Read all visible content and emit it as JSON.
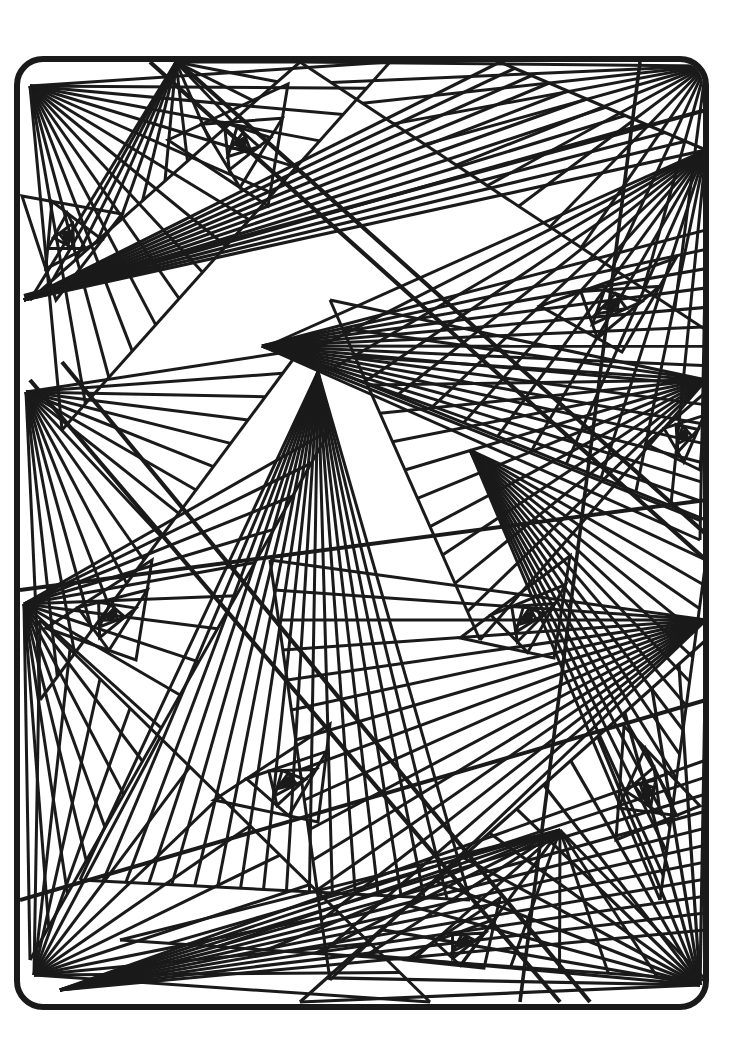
{
  "document": {
    "title": "Geometric Abstract Coloring Page",
    "kind": "line-art-coloring-page",
    "width": 755,
    "height": 1057,
    "background_color": "#ffffff",
    "ink_color": "#1a1a1a",
    "description": "Black-and-white geometric line drawing: rounded-rectangle frame filled with overlapping triangular fan bundles and nested triangle spirals."
  },
  "frame": {
    "name": "rounded-rectangle-border",
    "x": 17,
    "y": 59,
    "width": 689,
    "height": 948,
    "corner_radius": 26,
    "stroke_width": 6,
    "stroke_color": "#1a1a1a",
    "fill": "none"
  },
  "style": {
    "line_color": "#1a1a1a",
    "line_width_thin": 3.0,
    "line_width_medium": 3.6,
    "line_width_thick": 4.6,
    "line_cap": "butt",
    "line_join": "miter"
  },
  "geometry": {
    "clip_inset": 3,
    "fans": [
      {
        "name": "fan-top-left-corner",
        "apex": [
          30,
          86
        ],
        "a": [
          390,
          62
        ],
        "b": [
          62,
          430
        ],
        "rays": 14,
        "width": 3.0,
        "bias": 1.0
      },
      {
        "name": "fan-top-left-upper",
        "apex": [
          176,
          62
        ],
        "a": [
          30,
          300
        ],
        "b": [
          300,
          62
        ],
        "rays": 12,
        "width": 3.0,
        "bias": 1.0
      },
      {
        "name": "fan-top-band",
        "apex": [
          24,
          300
        ],
        "a": [
          500,
          62
        ],
        "b": [
          706,
          150
        ],
        "rays": 11,
        "width": 3.2,
        "bias": 1.1
      },
      {
        "name": "fan-top-right-sweep",
        "apex": [
          706,
          66
        ],
        "a": [
          300,
          62
        ],
        "b": [
          706,
          330
        ],
        "rays": 13,
        "width": 3.0,
        "bias": 1.0
      },
      {
        "name": "fan-upper-right-down",
        "apex": [
          706,
          150
        ],
        "a": [
          270,
          345
        ],
        "b": [
          706,
          520
        ],
        "rays": 13,
        "width": 3.0,
        "bias": 1.05
      },
      {
        "name": "fan-center-diagonal",
        "apex": [
          262,
          346
        ],
        "a": [
          706,
          230
        ],
        "b": [
          700,
          540
        ],
        "rays": 16,
        "width": 3.0,
        "bias": 1.0
      },
      {
        "name": "fan-left-mid-sweep",
        "apex": [
          26,
          392
        ],
        "a": [
          300,
          350
        ],
        "b": [
          40,
          700
        ],
        "rays": 15,
        "width": 3.0,
        "bias": 1.0
      },
      {
        "name": "fan-left-lower-sweep",
        "apex": [
          24,
          604
        ],
        "a": [
          330,
          430
        ],
        "b": [
          30,
          960
        ],
        "rays": 16,
        "width": 3.0,
        "bias": 1.0
      },
      {
        "name": "fan-center-down",
        "apex": [
          318,
          372
        ],
        "a": [
          80,
          880
        ],
        "b": [
          470,
          900
        ],
        "rays": 17,
        "width": 3.0,
        "bias": 1.0
      },
      {
        "name": "fan-mid-right-down",
        "apex": [
          470,
          450
        ],
        "a": [
          706,
          560
        ],
        "b": [
          660,
          900
        ],
        "rays": 14,
        "width": 3.0,
        "bias": 1.0
      },
      {
        "name": "fan-right-mid-left",
        "apex": [
          706,
          620
        ],
        "a": [
          270,
          560
        ],
        "b": [
          330,
          980
        ],
        "rays": 14,
        "width": 3.0,
        "bias": 1.0
      },
      {
        "name": "fan-bottom-left",
        "apex": [
          34,
          975
        ],
        "a": [
          40,
          620
        ],
        "b": [
          430,
          1002
        ],
        "rays": 13,
        "width": 3.0,
        "bias": 1.0
      },
      {
        "name": "fan-bottom-right-corner",
        "apex": [
          700,
          985
        ],
        "a": [
          706,
          640
        ],
        "b": [
          300,
          1002
        ],
        "rays": 15,
        "width": 3.2,
        "bias": 1.0
      },
      {
        "name": "fan-bottom-band",
        "apex": [
          60,
          990
        ],
        "a": [
          706,
          760
        ],
        "b": [
          706,
          930
        ],
        "rays": 10,
        "width": 3.0,
        "bias": 1.0
      },
      {
        "name": "fan-lower-center",
        "apex": [
          560,
          830
        ],
        "a": [
          120,
          940
        ],
        "b": [
          706,
          980
        ],
        "rays": 12,
        "width": 3.0,
        "bias": 1.0
      },
      {
        "name": "fan-right-upper-left",
        "apex": [
          706,
          380
        ],
        "a": [
          330,
          300
        ],
        "b": [
          480,
          640
        ],
        "rays": 12,
        "width": 3.0,
        "bias": 1.0
      }
    ],
    "spirals": [
      {
        "name": "spiral-top-left-small",
        "p1": [
          22,
          196
        ],
        "p2": [
          122,
          214
        ],
        "p3": [
          56,
          300
        ],
        "turns": 7,
        "t": 0.3,
        "width": 3.0
      },
      {
        "name": "spiral-top-center",
        "p1": [
          168,
          140
        ],
        "p2": [
          288,
          84
        ],
        "p3": [
          268,
          206
        ],
        "turns": 8,
        "t": 0.28,
        "width": 3.0
      },
      {
        "name": "spiral-upper-right",
        "p1": [
          540,
          306
        ],
        "p2": [
          676,
          258
        ],
        "p3": [
          622,
          352
        ],
        "turns": 8,
        "t": 0.3,
        "width": 3.0
      },
      {
        "name": "spiral-left-mid",
        "p1": [
          46,
          628
        ],
        "p2": [
          152,
          560
        ],
        "p3": [
          136,
          660
        ],
        "turns": 7,
        "t": 0.3,
        "width": 3.0
      },
      {
        "name": "spiral-center-right",
        "p1": [
          460,
          638
        ],
        "p2": [
          570,
          556
        ],
        "p3": [
          554,
          658
        ],
        "turns": 8,
        "t": 0.28,
        "width": 3.0
      },
      {
        "name": "spiral-lower-center",
        "p1": [
          214,
          800
        ],
        "p2": [
          330,
          724
        ],
        "p3": [
          318,
          822
        ],
        "turns": 8,
        "t": 0.28,
        "width": 3.0
      },
      {
        "name": "spiral-lower-right-tall",
        "p1": [
          616,
          840
        ],
        "p2": [
          624,
          726
        ],
        "p3": [
          700,
          806
        ],
        "turns": 8,
        "t": 0.28,
        "width": 3.0
      },
      {
        "name": "spiral-bottom-center",
        "p1": [
          406,
          960
        ],
        "p2": [
          500,
          898
        ],
        "p3": [
          484,
          968
        ],
        "turns": 7,
        "t": 0.3,
        "width": 3.0
      },
      {
        "name": "spiral-right-edge",
        "p1": [
          646,
          444
        ],
        "p2": [
          706,
          392
        ],
        "p3": [
          700,
          470
        ],
        "turns": 6,
        "t": 0.3,
        "width": 3.0
      }
    ],
    "bands": [
      {
        "name": "band-major-diagonal-outer",
        "from": [
          150,
          62
        ],
        "to": [
          706,
          560
        ],
        "width": 4.2
      },
      {
        "name": "band-major-diagonal-inner",
        "from": [
          178,
          62
        ],
        "to": [
          706,
          534
        ],
        "width": 4.2
      },
      {
        "name": "band-cross-diagonal-a",
        "from": [
          30,
          380
        ],
        "to": [
          560,
          1002
        ],
        "width": 4.2
      },
      {
        "name": "band-cross-diagonal-b",
        "from": [
          62,
          362
        ],
        "to": [
          590,
          1002
        ],
        "width": 4.2
      },
      {
        "name": "band-upper-sweep",
        "from": [
          24,
          296
        ],
        "to": [
          706,
          110
        ],
        "width": 4.0
      },
      {
        "name": "band-mid-sweep",
        "from": [
          20,
          590
        ],
        "to": [
          706,
          500
        ],
        "width": 4.0
      },
      {
        "name": "band-lower-sweep",
        "from": [
          20,
          900
        ],
        "to": [
          706,
          700
        ],
        "width": 4.0
      },
      {
        "name": "band-right-vert",
        "from": [
          640,
          62
        ],
        "to": [
          520,
          1002
        ],
        "width": 3.6
      }
    ]
  },
  "chart_data": {
    "type": "line",
    "title": "Geometric Abstract Coloring Page",
    "xlabel": "",
    "ylabel": "",
    "note": "Non-quantitative decorative line art; no axes, legend, or numeric data present."
  }
}
